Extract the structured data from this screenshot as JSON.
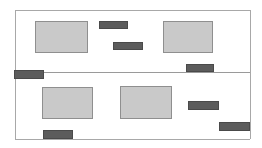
{
  "diagram": {
    "canvas": {
      "width": 262,
      "height": 148,
      "background": "#ffffff"
    },
    "colors": {
      "frame": "#a8a8a8",
      "divider": "#9a9a9a",
      "block_fill": "#c9c9c9",
      "block_border": "#8f8f8f",
      "bar_fill": "#5c5c5c",
      "bar_border": "#4a4a4a"
    },
    "frame": {
      "left_x": 15,
      "right_x": 250,
      "top_y": 10,
      "bottom_y": 139
    },
    "divider": {
      "label": "panel-divider",
      "x": 15,
      "y": 72,
      "width": 235
    },
    "panels": [
      {
        "label": "upper-panel",
        "x": 15,
        "y": 10,
        "width": 235,
        "height": 62
      },
      {
        "label": "lower-panel",
        "x": 15,
        "y": 72,
        "width": 235,
        "height": 67
      }
    ],
    "blocks": [
      {
        "label": "block-top-left",
        "panel": "upper-panel",
        "x": 35,
        "y": 21,
        "width": 53,
        "height": 32
      },
      {
        "label": "block-top-right",
        "panel": "upper-panel",
        "x": 163,
        "y": 21,
        "width": 50,
        "height": 32
      },
      {
        "label": "block-bottom-left",
        "panel": "lower-panel",
        "x": 42,
        "y": 87,
        "width": 51,
        "height": 32
      },
      {
        "label": "block-bottom-center",
        "panel": "lower-panel",
        "x": 120,
        "y": 86,
        "width": 52,
        "height": 33
      }
    ],
    "bars": [
      {
        "label": "bar-top-upper",
        "panel": "upper-panel",
        "x": 99,
        "y": 21,
        "width": 29,
        "height": 8
      },
      {
        "label": "bar-top-lower",
        "panel": "upper-panel",
        "x": 113,
        "y": 42,
        "width": 30,
        "height": 8
      },
      {
        "label": "bar-divider-right",
        "panel": "upper-panel",
        "x": 186,
        "y": 64,
        "width": 28,
        "height": 8
      },
      {
        "label": "bar-divider-left",
        "panel": "lower-panel",
        "x": 14,
        "y": 70,
        "width": 30,
        "height": 9
      },
      {
        "label": "bar-mid-right",
        "panel": "lower-panel",
        "x": 188,
        "y": 101,
        "width": 31,
        "height": 9
      },
      {
        "label": "bar-far-right",
        "panel": "lower-panel",
        "x": 219,
        "y": 122,
        "width": 31,
        "height": 9
      },
      {
        "label": "bar-baseline-left",
        "panel": "lower-panel",
        "x": 43,
        "y": 130,
        "width": 30,
        "height": 9
      }
    ]
  }
}
